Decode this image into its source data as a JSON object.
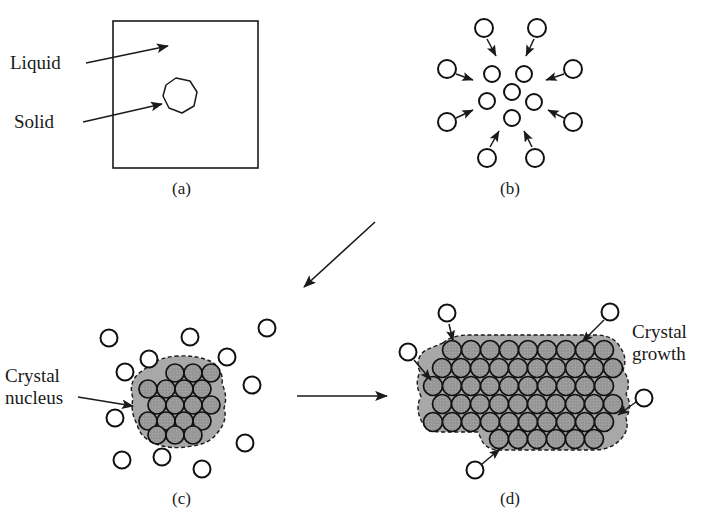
{
  "figure": {
    "background_color": "#ffffff",
    "ink_color": "#1a1a1a",
    "crystal_fill_color": "#9a9a9a",
    "crystal_halo_color": "#a8a8a8",
    "particle_fill_color": "#ffffff",
    "particle_stroke_color": "#111111"
  },
  "labels": {
    "liquid": "Liquid",
    "solid": "Solid",
    "crystal_nucleus_line1": "Crystal",
    "crystal_nucleus_line2": "nucleus",
    "crystal_growth_line1": "Crystal",
    "crystal_growth_line2": "growth"
  },
  "captions": {
    "a": "(a)",
    "b": "(b)",
    "c": "(c)",
    "d": "(d)"
  },
  "bottom_cropped_text": "",
  "panels": {
    "a": {
      "caption": "(a)",
      "container": {
        "x": 113,
        "y": 21,
        "width": 145,
        "height": 147
      },
      "solid_blob_center": {
        "x": 176,
        "y": 97
      },
      "pointers": [
        {
          "label": "Liquid",
          "from": {
            "x": 86,
            "y": 63
          },
          "to": {
            "x": 171,
            "y": 46
          }
        },
        {
          "label": "Solid",
          "from": {
            "x": 83,
            "y": 122
          },
          "to": {
            "x": 165,
            "y": 104
          }
        }
      ]
    },
    "b": {
      "caption": "(b)",
      "center": {
        "x": 512,
        "y": 95
      },
      "cluster_particle_count": 7,
      "incoming_particle_count": 8,
      "particle_radius": 8
    },
    "c": {
      "caption": "(c)",
      "nucleus_center": {
        "x": 175,
        "y": 405
      },
      "nucleus_particle_rows": [
        3,
        4,
        4,
        4
      ],
      "free_particle_count": 12,
      "particle_radius": 8,
      "pointer": {
        "label": "Crystal nucleus",
        "from": {
          "x": 78,
          "y": 399
        },
        "to": {
          "x": 136,
          "y": 406
        }
      }
    },
    "d": {
      "caption": "(d)",
      "crystal_center": {
        "x": 505,
        "y": 400
      },
      "crystal_particle_rows": [
        6,
        6,
        6,
        6,
        5,
        4
      ],
      "attaching_particle_count": 5,
      "particle_radius": 8,
      "label": "Crystal growth"
    }
  },
  "flow_arrows": [
    {
      "name": "b-to-c",
      "from": {
        "x": 375,
        "y": 222
      },
      "to": {
        "x": 301,
        "y": 290
      }
    },
    {
      "name": "c-to-d",
      "from": {
        "x": 297,
        "y": 396
      },
      "to": {
        "x": 384,
        "y": 396
      }
    }
  ]
}
